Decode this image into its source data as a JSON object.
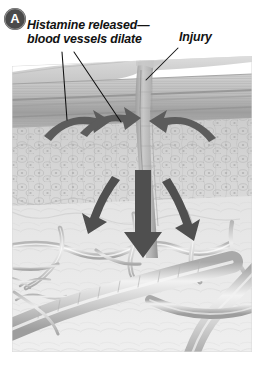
{
  "figure": {
    "panel_letter": "A",
    "caption_labels": {
      "histamine_line1": "Histamine released—",
      "histamine_line2": "blood vessels dilate",
      "injury": "Injury"
    },
    "colors": {
      "badge_fill": "#4a4a4a",
      "badge_text": "#ffffff",
      "label_text": "#121212",
      "leader_line": "#111111",
      "arrow_fill": "#5c5c5c",
      "epidermis_top": "#d8d8d8",
      "epidermis_band": "#a9a9a9",
      "dermis": "#cfcfcf",
      "subcutaneous": "#e9e9e9",
      "vessel": "#c2c2c2",
      "background": "#ffffff"
    },
    "anatomy": {
      "layers": [
        "epidermis-surface",
        "epidermis-banded-strata",
        "dermis-cellular",
        "subcutaneous-tissue",
        "blood-vessel-network"
      ],
      "wound_channel": "vertical-puncture-at-center",
      "arrow_count": 6,
      "arrow_meaning": "histamine-diffusion-and-vasodilation-direction"
    }
  }
}
